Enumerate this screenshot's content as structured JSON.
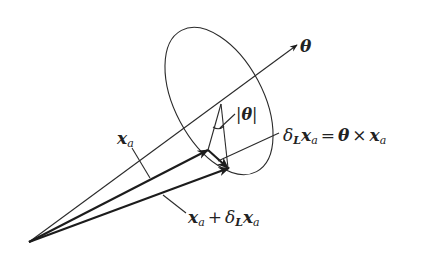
{
  "diagram": {
    "colors": {
      "stroke": "#2a2a2a",
      "background": "#ffffff"
    },
    "labels": {
      "axis": "θ",
      "angle": "|θ|",
      "position_vector": {
        "main": "x",
        "sub": "a"
      },
      "rotated_vector": {
        "x1": "x",
        "sub1": "a",
        "plus": "+",
        "delta": "δ",
        "delta_sub": "L",
        "x2": "x",
        "sub2": "a"
      },
      "variation_eq": {
        "delta": "δ",
        "delta_sub": "L",
        "x1": "x",
        "sub1": "a",
        "eq": "=",
        "theta": "θ",
        "times": "×",
        "x2": "x",
        "sub2": "a"
      }
    },
    "elements": [
      "rotation-axis-theta",
      "cone-circle-ellipse",
      "vector-x_a",
      "vector-x_a-plus-delta",
      "delta-vector",
      "angle-arc"
    ]
  }
}
